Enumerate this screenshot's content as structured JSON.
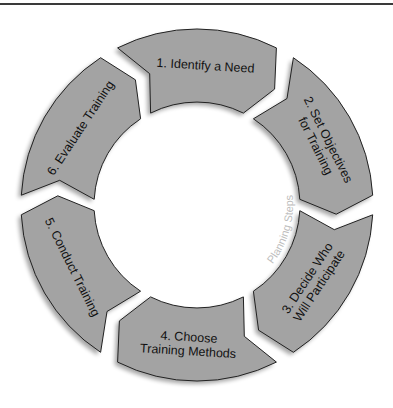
{
  "diagram": {
    "center_label": "Planning Steps",
    "colors": {
      "segment_fill": "#a3a3a3",
      "segment_stroke": "#222222",
      "text": "#111111",
      "center_label": "#bdbdbd",
      "rule": "#3a3a3a"
    },
    "geometry": {
      "cx": 197,
      "cy": 205,
      "outer_r": 176,
      "inner_r": 103
    },
    "steps": [
      {
        "number": 1,
        "lines": [
          "1. Identify a Need"
        ]
      },
      {
        "number": 2,
        "lines": [
          "2. Set Objectives",
          "for Training"
        ]
      },
      {
        "number": 3,
        "lines": [
          "3. Decide Who",
          "Will Participate"
        ]
      },
      {
        "number": 4,
        "lines": [
          "4. Choose",
          "Training Methods"
        ]
      },
      {
        "number": 5,
        "lines": [
          "5. Conduct Training"
        ]
      },
      {
        "number": 6,
        "lines": [
          "6. Evaluate Training"
        ]
      }
    ]
  }
}
